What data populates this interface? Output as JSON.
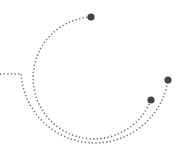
{
  "graphic": {
    "description": "decorative dotted arcs with endpoint nodes",
    "colors": {
      "dots": "#7a7a7a",
      "nodes": "#444444",
      "background": "#ffffff"
    },
    "nodes": [
      {
        "name": "top-node",
        "cx": 91,
        "cy": 17,
        "r": 3.6
      },
      {
        "name": "right-upper-node",
        "cx": 168,
        "cy": 80,
        "r": 3.6
      },
      {
        "name": "right-lower-node",
        "cx": 151,
        "cy": 100,
        "r": 3.6
      }
    ]
  }
}
